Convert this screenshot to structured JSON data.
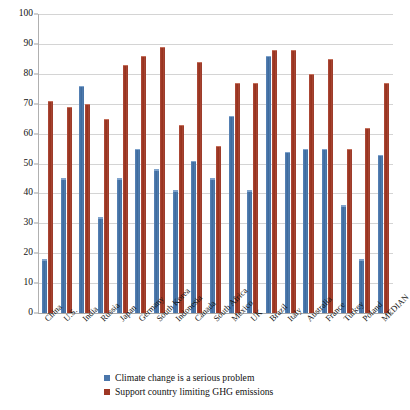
{
  "chart_data": {
    "type": "bar",
    "title": "",
    "xlabel": "",
    "ylabel": "",
    "ylim": [
      0,
      100
    ],
    "yticks": [
      0,
      10,
      20,
      30,
      40,
      50,
      60,
      70,
      80,
      90,
      100
    ],
    "grid": true,
    "legend_position": "bottom",
    "categories": [
      "China",
      "U.S.",
      "India",
      "Russia",
      "Japan",
      "Germany",
      "South Korea",
      "Indonesia",
      "Canada",
      "South Africa",
      "Mexico",
      "UK",
      "Brazil",
      "Italy",
      "Australia",
      "France",
      "Turkey",
      "Poland",
      "MEDIAN"
    ],
    "series": [
      {
        "name": "Climate change is a serious problem",
        "color": "#4a76ab",
        "values": [
          18,
          45,
          76,
          32,
          45,
          55,
          48,
          41,
          51,
          45,
          66,
          41,
          86,
          54,
          55,
          55,
          36,
          18,
          53
        ]
      },
      {
        "name": "Support country limiting GHG emissions",
        "color": "#9e3724",
        "values": [
          71,
          69,
          70,
          65,
          83,
          86,
          89,
          63,
          84,
          56,
          77,
          77,
          88,
          88,
          80,
          85,
          55,
          62,
          77
        ]
      }
    ]
  },
  "legend": {
    "items": [
      {
        "label": "Climate change is a serious problem",
        "swatch": "blue"
      },
      {
        "label": "Support country limiting GHG emissions",
        "swatch": "red"
      }
    ]
  }
}
